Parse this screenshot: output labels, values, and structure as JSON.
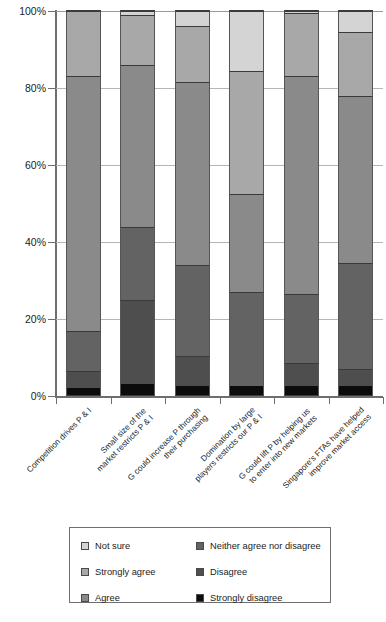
{
  "chart_data": {
    "type": "bar",
    "subtype": "stacked-percentage",
    "title": "",
    "xlabel": "",
    "ylabel": "",
    "ylim": [
      0,
      100
    ],
    "ytick_labels": [
      "0%",
      "20%",
      "40%",
      "60%",
      "80%",
      "100%"
    ],
    "ytick_values": [
      0,
      20,
      40,
      60,
      80,
      100
    ],
    "grid": true,
    "grid_axis": "y",
    "legend_position": "bottom",
    "stack_order_bottom_to_top": [
      "Strongly disagree",
      "Disagree",
      "Neither agree nor disagree",
      "Agree",
      "Strongly agree",
      "Not sure"
    ],
    "categories": [
      "Competition drives P & I",
      "Small size of the market restricts P & I",
      "G could increase P through their purchasing",
      "Domination by large players restricts our P & I",
      "G could lift P by helping us to enter into new markets",
      "Singapore's FTAs have helped improve market access"
    ],
    "category_lines": [
      [
        "Competition drives P & I"
      ],
      [
        "Small size of the",
        "market restricts P & I"
      ],
      [
        "G could increase P through",
        "their purchasing"
      ],
      [
        "Domination by large",
        "players restricts our P & I"
      ],
      [
        "G could lift P by helping us",
        "to enter into new markets"
      ],
      [
        "Singapore's FTAs have helped",
        "improve market access"
      ]
    ],
    "series": [
      {
        "name": "Strongly disagree",
        "color": "#0c0c0c",
        "values": [
          2.0,
          3.0,
          2.5,
          2.5,
          2.5,
          2.5
        ]
      },
      {
        "name": "Disagree",
        "color": "#4e4e4e",
        "values": [
          4.5,
          22.0,
          8.0,
          0.0,
          6.0,
          4.5
        ]
      },
      {
        "name": "Neither agree nor disagree",
        "color": "#636363",
        "values": [
          10.5,
          19.0,
          23.5,
          24.5,
          18.0,
          27.5
        ]
      },
      {
        "name": "Agree",
        "color": "#8a8a8a",
        "values": [
          66.0,
          42.0,
          47.5,
          25.5,
          56.5,
          43.5
        ]
      },
      {
        "name": "Strongly agree",
        "color": "#a8a8a8",
        "values": [
          17.0,
          13.0,
          14.5,
          32.0,
          16.5,
          16.5
        ]
      },
      {
        "name": "Not sure",
        "color": "#d4d4d4",
        "values": [
          0.0,
          1.0,
          4.0,
          15.5,
          0.5,
          5.5
        ]
      }
    ]
  },
  "legend": {
    "columns": [
      {
        "items": [
          {
            "label": "Not sure",
            "color": "#d4d4d4"
          },
          {
            "label": "Strongly agree",
            "color": "#a8a8a8"
          },
          {
            "label": "Agree",
            "color": "#8a8a8a"
          }
        ]
      },
      {
        "items": [
          {
            "label": "Neither agree nor disagree",
            "color": "#636363"
          },
          {
            "label": "Disagree",
            "color": "#4e4e4e"
          },
          {
            "label": "Strongly disagree",
            "color": "#0c0c0c"
          }
        ]
      }
    ]
  }
}
